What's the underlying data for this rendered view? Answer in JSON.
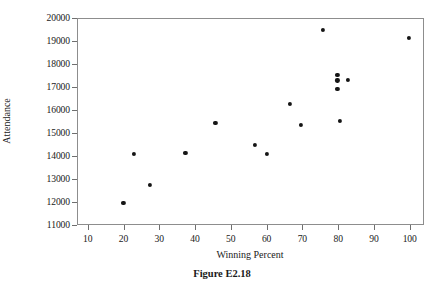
{
  "figure": {
    "caption": "Figure E2.18"
  },
  "axes": {
    "x_title": "Winning Percent",
    "y_title": "Attendance",
    "x_ticks": [
      "10",
      "20",
      "30",
      "40",
      "50",
      "60",
      "70",
      "80",
      "90",
      "100"
    ],
    "y_ticks": [
      "11000",
      "12000",
      "13000",
      "14000",
      "15000",
      "16000",
      "17000",
      "18000",
      "19000",
      "20000"
    ]
  },
  "chart_data": {
    "type": "scatter",
    "title": "Figure E2.18",
    "xlabel": "Winning Percent",
    "ylabel": "Attendance",
    "xlim": [
      7,
      104
    ],
    "ylim": [
      11000,
      20000
    ],
    "xticks": [
      10,
      20,
      30,
      40,
      50,
      60,
      70,
      80,
      90,
      100
    ],
    "yticks": [
      11000,
      12000,
      13000,
      14000,
      15000,
      16000,
      17000,
      18000,
      19000,
      20000
    ],
    "grid": false,
    "legend": null,
    "marker": "filled-circle",
    "marker_color": "#151515",
    "points": [
      {
        "x": 19.7,
        "y": 12000
      },
      {
        "x": 22.7,
        "y": 14130
      },
      {
        "x": 27.0,
        "y": 12780
      },
      {
        "x": 37.0,
        "y": 14170
      },
      {
        "x": 45.4,
        "y": 15480
      },
      {
        "x": 56.5,
        "y": 14520
      },
      {
        "x": 59.7,
        "y": 14130
      },
      {
        "x": 66.2,
        "y": 16300
      },
      {
        "x": 69.2,
        "y": 15390
      },
      {
        "x": 75.4,
        "y": 19520
      },
      {
        "x": 79.5,
        "y": 17570
      },
      {
        "x": 79.5,
        "y": 17330
      },
      {
        "x": 79.5,
        "y": 16960
      },
      {
        "x": 80.3,
        "y": 15560
      },
      {
        "x": 82.4,
        "y": 17350
      },
      {
        "x": 99.5,
        "y": 19170
      }
    ]
  }
}
